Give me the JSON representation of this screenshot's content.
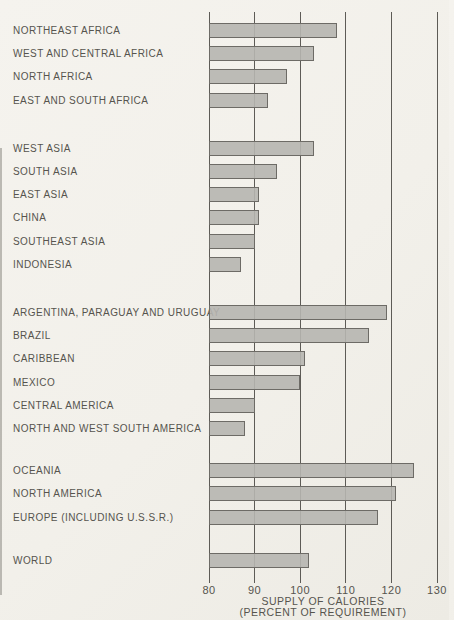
{
  "figure": {
    "background": "#f3f1ec",
    "bar_fill": "#b6b5b0",
    "bar_border": "#6d6b66",
    "gridline_color": "#5d5b56",
    "text_color": "#56544e"
  },
  "chart_data": {
    "type": "bar",
    "orientation": "horizontal",
    "title": "",
    "xlabel_line1": "SUPPLY OF CALORIES",
    "xlabel_line2": "(PERCENT OF REQUIREMENT)",
    "xlim": [
      80,
      130
    ],
    "ticks": [
      80,
      90,
      100,
      110,
      120,
      130
    ],
    "grid": true,
    "groups": [
      {
        "rows": [
          {
            "label": "NORTHEAST AFRICA",
            "value": 108
          },
          {
            "label": "WEST AND CENTRAL AFRICA",
            "value": 103
          },
          {
            "label": "NORTH AFRICA",
            "value": 97
          },
          {
            "label": "EAST AND SOUTH AFRICA",
            "value": 93
          }
        ]
      },
      {
        "rows": [
          {
            "label": "WEST ASIA",
            "value": 103
          },
          {
            "label": "SOUTH ASIA",
            "value": 95
          },
          {
            "label": "EAST ASIA",
            "value": 91
          },
          {
            "label": "CHINA",
            "value": 91
          },
          {
            "label": "SOUTHEAST ASIA",
            "value": 90
          },
          {
            "label": "INDONESIA",
            "value": 87
          }
        ]
      },
      {
        "rows": [
          {
            "label": "ARGENTINA, PARAGUAY AND URUGUAY",
            "value": 119
          },
          {
            "label": "BRAZIL",
            "value": 115
          },
          {
            "label": "CARIBBEAN",
            "value": 101
          },
          {
            "label": "MEXICO",
            "value": 100
          },
          {
            "label": "CENTRAL AMERICA",
            "value": 90
          },
          {
            "label": "NORTH AND WEST SOUTH AMERICA",
            "value": 88
          }
        ]
      },
      {
        "rows": [
          {
            "label": "OCEANIA",
            "value": 125
          },
          {
            "label": "NORTH AMERICA",
            "value": 121
          },
          {
            "label": "EUROPE (INCLUDING U.S.S.R.)",
            "value": 117
          }
        ]
      },
      {
        "rows": [
          {
            "label": "WORLD",
            "value": 102
          }
        ]
      }
    ]
  }
}
